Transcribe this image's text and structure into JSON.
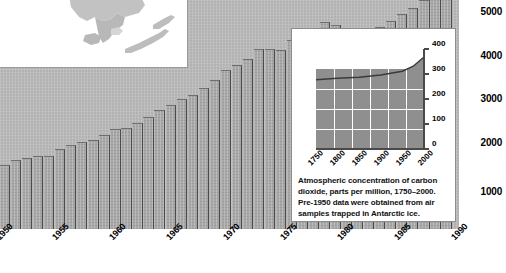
{
  "figure": {
    "name": "atmospheric-co2-and-emissions-figure"
  },
  "chart_data": [
    {
      "type": "bar",
      "title": "",
      "xlabel": "",
      "ylabel": "",
      "ylim": [
        0,
        5800
      ],
      "yticks": [
        1000,
        2000,
        3000,
        4000,
        5000
      ],
      "xticks": [
        "1950",
        "1955",
        "1960",
        "1965",
        "1970",
        "1975",
        "1980",
        "1985",
        "1990"
      ],
      "grid": false,
      "legend": "none",
      "categories": [
        "1950",
        "1951",
        "1952",
        "1953",
        "1954",
        "1955",
        "1956",
        "1957",
        "1958",
        "1959",
        "1960",
        "1961",
        "1962",
        "1963",
        "1964",
        "1965",
        "1966",
        "1967",
        "1968",
        "1969",
        "1970",
        "1971",
        "1972",
        "1973",
        "1974",
        "1975",
        "1976",
        "1977",
        "1978",
        "1979",
        "1980",
        "1981",
        "1982",
        "1983",
        "1984",
        "1985",
        "1986",
        "1987",
        "1988",
        "1989",
        "1990"
      ],
      "values": [
        1620,
        1760,
        1790,
        1840,
        1860,
        2020,
        2130,
        2200,
        2250,
        2380,
        2530,
        2570,
        2690,
        2830,
        3010,
        3130,
        3300,
        3400,
        3570,
        3770,
        4040,
        4150,
        4310,
        4560,
        4550,
        4530,
        4780,
        4910,
        4970,
        5240,
        5170,
        4990,
        4930,
        4940,
        5110,
        5270,
        5440,
        5590,
        5800,
        5820,
        5890
      ]
    },
    {
      "type": "area",
      "title": "",
      "xlabel": "",
      "ylabel": "",
      "ylim": [
        0,
        400
      ],
      "yticks": [
        0,
        100,
        200,
        300,
        400
      ],
      "xticks": [
        "1750",
        "1800",
        "1850",
        "1900",
        "1950",
        "2000"
      ],
      "grid": true,
      "legend": "none",
      "x": [
        1750,
        1800,
        1850,
        1900,
        1950,
        1975,
        2000
      ],
      "values": [
        277,
        283,
        287,
        296,
        311,
        331,
        368
      ]
    }
  ],
  "right_axis": {
    "ticks": [
      {
        "label": "5000"
      },
      {
        "label": "4000"
      },
      {
        "label": "3000"
      },
      {
        "label": "2000"
      },
      {
        "label": "1000"
      }
    ]
  },
  "x_axis": {
    "ticks": [
      {
        "label": "1950"
      },
      {
        "label": "1955"
      },
      {
        "label": "1960"
      },
      {
        "label": "1965"
      },
      {
        "label": "1970"
      },
      {
        "label": "1975"
      },
      {
        "label": "1980"
      },
      {
        "label": "1985"
      },
      {
        "label": "1990"
      }
    ]
  },
  "co2_inset": {
    "y_ticks": [
      {
        "label": "400"
      },
      {
        "label": "300"
      },
      {
        "label": "200"
      },
      {
        "label": "100"
      },
      {
        "label": "0"
      }
    ],
    "x_ticks": [
      {
        "label": "1750"
      },
      {
        "label": "1800"
      },
      {
        "label": "1850"
      },
      {
        "label": "1900"
      },
      {
        "label": "1950"
      },
      {
        "label": "2000"
      }
    ],
    "caption": {
      "line1": "Atmospheric concentration of carbon",
      "line2": "dioxide, parts per million, 1750–2000.",
      "line3": "Pre-1950 data were obtained from air",
      "line4": "samples trapped in Antarctic ice."
    }
  },
  "map_inset": {
    "name": "locator-map"
  },
  "colors": {
    "plot_background": "#b2b2b2",
    "bar_fill": "#a8a8a8",
    "bar_edge": "#4b4b4b",
    "inset_fill": "#8f8f8f",
    "page_background": "#ffffff",
    "text": "#000000"
  }
}
